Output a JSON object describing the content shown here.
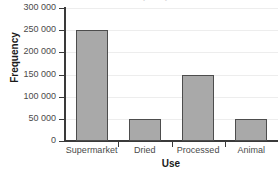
{
  "chart_data": {
    "type": "bar",
    "title": "Frequency of use 2002",
    "xlabel": "Use",
    "ylabel": "Frequency",
    "categories": [
      "Supermarket",
      "Dried",
      "Processed",
      "Animal"
    ],
    "values": [
      250000,
      50000,
      150000,
      50000
    ],
    "ylim": [
      0,
      300000
    ],
    "ytick_values": [
      0,
      50000,
      100000,
      150000,
      200000,
      250000,
      300000
    ],
    "ytick_labels": [
      "0",
      "50 000",
      "100 000",
      "150 000",
      "200 000",
      "250 000",
      "300 000"
    ],
    "grid": "horizontal",
    "legend": "none",
    "bar_color": "#a9a9a9",
    "bar_edge_color": "#4d4d4d",
    "grid_color": "#ededed",
    "axis_color": "#3a3a3a"
  }
}
